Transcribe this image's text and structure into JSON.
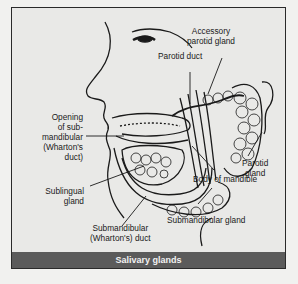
{
  "figure": {
    "caption": "Salivary glands",
    "labels": {
      "accessory_parotid": "Accessory\nparotid gland",
      "parotid_duct": "Parotid duct",
      "opening": "Opening\nof sub-\nmandibular\n(Wharton's\nduct)",
      "parotid_gland": "Parotid\ngland",
      "body_mandible": "Body of mandible",
      "sublingual": "Sublingual\ngland",
      "submandibular_duct": "Submandibular\n(Wharton's) duct",
      "submandibular_gland": "Submandibular gland"
    },
    "colors": {
      "caption_bg": "#5b5b5b",
      "panel_bg": "#e9e9e7",
      "line": "#1a1a1a"
    }
  }
}
